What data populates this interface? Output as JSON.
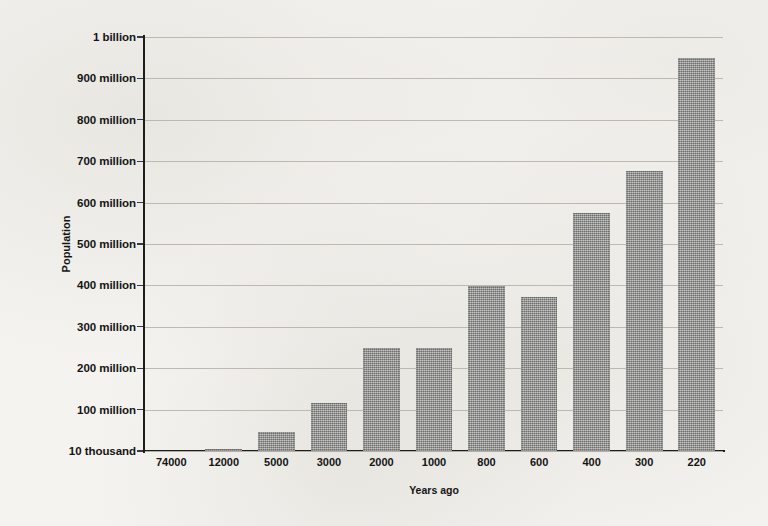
{
  "chart_data": {
    "type": "bar",
    "title": "",
    "xlabel": "Years ago",
    "ylabel": "Population",
    "categories": [
      "74000",
      "12000",
      "5000",
      "3000",
      "2000",
      "1000",
      "800",
      "600",
      "400",
      "300",
      "220"
    ],
    "values": [
      0,
      5000000,
      45000000,
      117000000,
      248000000,
      248000000,
      398000000,
      373000000,
      575000000,
      677000000,
      950000000
    ],
    "ylim": [
      0,
      1000000000
    ],
    "y_tick_values": [
      1000000000,
      900000000,
      800000000,
      700000000,
      600000000,
      500000000,
      400000000,
      300000000,
      200000000,
      100000000,
      10000
    ],
    "y_tick_labels": [
      "1 billion",
      "900 million",
      "800 million",
      "700 million",
      "600 million",
      "500 million",
      "400 million",
      "300 million",
      "200 million",
      "100 million",
      "10 thousand"
    ],
    "grid": true,
    "legend": false,
    "bar_color": "#8a8a88",
    "axis_color": "#1d1d1d",
    "grid_color": "#b9b6ae",
    "background_color": "#f4f3ef"
  }
}
